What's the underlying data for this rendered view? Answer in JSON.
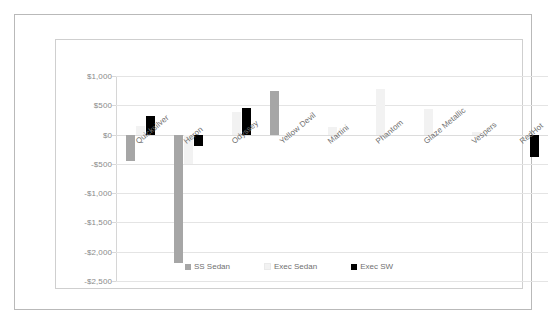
{
  "chart_data": {
    "type": "bar",
    "title": "",
    "subtitle": "",
    "xlabel": "",
    "ylabel": "",
    "ylim": [
      -2500,
      1000
    ],
    "ytick_values": [
      1000,
      500,
      0,
      -500,
      -1000,
      -1500,
      -2000,
      -2500
    ],
    "ytick_labels": [
      "$1,000",
      "$500",
      "$0",
      "-$500",
      "-$1,000",
      "-$1,500",
      "-$2,000",
      "-$2,500"
    ],
    "grid": true,
    "legend_position": "bottom",
    "categories": [
      "Quicksilver",
      "Heron",
      "Odyssey",
      "Yellow Devil",
      "Martini",
      "Phantom",
      "Glaze Metallic",
      "Vespers",
      "RedHot"
    ],
    "series": [
      {
        "name": "SS Sedan",
        "color": "#a6a6a6",
        "values": [
          -450,
          -2200,
          0,
          750,
          0,
          0,
          0,
          0,
          0
        ]
      },
      {
        "name": "Exec Sedan",
        "color": "#f2f2f2",
        "values": [
          150,
          -500,
          380,
          0,
          130,
          770,
          430,
          50,
          0
        ]
      },
      {
        "name": "Exec SW",
        "color": "#000000",
        "values": [
          320,
          -200,
          450,
          0,
          0,
          0,
          0,
          0,
          -380
        ]
      }
    ]
  },
  "legend": {
    "items": [
      {
        "label": "SS Sedan",
        "swatch": "square-marker-gray"
      },
      {
        "label": "Exec Sedan",
        "swatch": "square-marker-light-gray"
      },
      {
        "label": "Exec SW",
        "swatch": "square-marker-black"
      }
    ]
  },
  "colors": {
    "series_ss_sedan": "#a6a6a6",
    "series_exec_sedan": "#f2f2f2",
    "series_exec_sw": "#000000",
    "gridline": "#e4e4e4",
    "axis_text": "#8a8a8a",
    "category_text": "#6f6f6f",
    "chart_border": "#cfcfcf",
    "outer_border": "#b9b9b9"
  }
}
